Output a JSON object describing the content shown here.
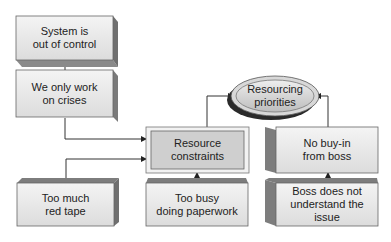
{
  "diagram": {
    "nodes": [
      {
        "id": "system_out_of_control",
        "line1": "System is",
        "line2": "out of control"
      },
      {
        "id": "only_work_on_crises",
        "line1": "We only work",
        "line2": "on crises"
      },
      {
        "id": "resourcing_priorities",
        "line1": "Resourcing",
        "line2": "priorities"
      },
      {
        "id": "resource_constraints",
        "line1": "Resource",
        "line2": "constraints"
      },
      {
        "id": "no_buy_in",
        "line1": "No buy-in",
        "line2": "from boss"
      },
      {
        "id": "red_tape",
        "line1": "Too much",
        "line2": "red tape"
      },
      {
        "id": "paperwork",
        "line1": "Too busy",
        "line2": "doing paperwork"
      },
      {
        "id": "boss_not_understand",
        "line1": "Boss does not",
        "line2": "understand the issue"
      }
    ],
    "edges": [
      {
        "from": "only_work_on_crises",
        "to": "system_out_of_control"
      },
      {
        "from": "only_work_on_crises",
        "to": "resource_constraints"
      },
      {
        "from": "red_tape",
        "to": "resource_constraints"
      },
      {
        "from": "paperwork",
        "to": "resource_constraints"
      },
      {
        "from": "resource_constraints",
        "to": "resourcing_priorities"
      },
      {
        "from": "no_buy_in",
        "to": "resourcing_priorities"
      },
      {
        "from": "boss_not_understand",
        "to": "no_buy_in"
      }
    ]
  }
}
